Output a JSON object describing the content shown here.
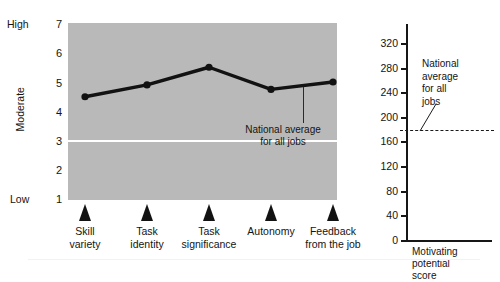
{
  "chart_data": [
    {
      "type": "line",
      "id": "job-characteristics-profile",
      "title": "",
      "xlabel": "",
      "ylabel": "",
      "grid": false,
      "legend": "none",
      "categories": [
        "Skill variety",
        "Task identity",
        "Task significance",
        "Autonomy",
        "Feedback from the job"
      ],
      "values": [
        4.5,
        4.9,
        5.5,
        4.75,
        5.0
      ],
      "ylim": [
        1,
        7
      ],
      "yticks": [
        "7",
        "6",
        "5",
        "4",
        "3",
        "2",
        "1"
      ],
      "band_labels": {
        "high": "High",
        "moderate": "Moderate",
        "low": "Low"
      },
      "annotations": [
        {
          "text_line1": "National average",
          "text_line2": "for all jobs",
          "value": 4.0,
          "style": "white-reference-line"
        }
      ]
    },
    {
      "type": "line",
      "id": "motivating-potential-score",
      "title": "",
      "xlabel": "Motivating potential score",
      "ylabel": "",
      "grid": false,
      "legend": "none",
      "ylim": [
        0,
        340
      ],
      "yticks": [
        "320",
        "280",
        "240",
        "200",
        "160",
        "120",
        "80",
        "40",
        "0"
      ],
      "annotations": [
        {
          "text_line1": "National",
          "text_line2": "average",
          "text_line3": "for all",
          "text_line4": "jobs",
          "value": 128,
          "style": "dashed-reference-line"
        }
      ]
    }
  ],
  "left_chart": {
    "band_high": "High",
    "band_moderate": "Moderate",
    "band_low": "Low",
    "yticks": [
      {
        "label": "7"
      },
      {
        "label": "6"
      },
      {
        "label": "5"
      },
      {
        "label": "4"
      },
      {
        "label": "3"
      },
      {
        "label": "2"
      },
      {
        "label": "1"
      }
    ],
    "xlabels": [
      {
        "line1": "Skill",
        "line2": "variety"
      },
      {
        "line1": "Task",
        "line2": "identity"
      },
      {
        "line1": "Task",
        "line2": "significance"
      },
      {
        "line1": "Autonomy",
        "line2": ""
      },
      {
        "line1": "Feedback",
        "line2": "from the job"
      }
    ],
    "callout_line1": "National average",
    "callout_line2": "for all jobs",
    "plot_fill": "#b9b9b9",
    "series_color": "#121212",
    "reference_line_color": "#ffffff"
  },
  "right_chart": {
    "yticks": [
      {
        "label": "320"
      },
      {
        "label": "280"
      },
      {
        "label": "240"
      },
      {
        "label": "200"
      },
      {
        "label": "160"
      },
      {
        "label": "120"
      },
      {
        "label": "80"
      },
      {
        "label": "40"
      },
      {
        "label": "0"
      }
    ],
    "callout_line1": "National",
    "callout_line2": "average",
    "callout_line3": "for all",
    "callout_line4": "jobs",
    "xlabel_line1": "Motivating",
    "xlabel_line2": "potential",
    "xlabel_line3": "score",
    "axis_color": "#161616",
    "dash_color": "#1a1a1a"
  }
}
